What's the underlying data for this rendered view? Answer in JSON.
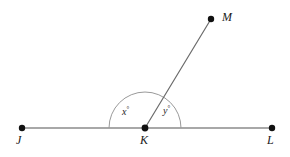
{
  "figure": {
    "type": "geometry-diagram",
    "width": 290,
    "height": 157,
    "background_color": "#ffffff",
    "line_color": "#8c8c8c",
    "ray_color": "#6b6b6b",
    "arc_color": "#9a9a9a",
    "point_color": "#111111",
    "label_color": "#1a1a1a"
  },
  "points": [
    {
      "id": "J",
      "label": "J",
      "x": 22,
      "y": 128,
      "label_x": 16,
      "label_y": 134,
      "radius": 3.2
    },
    {
      "id": "K",
      "label": "K",
      "x": 145,
      "y": 128,
      "label_x": 140,
      "label_y": 134,
      "radius": 3.4
    },
    {
      "id": "L",
      "label": "L",
      "x": 272,
      "y": 128,
      "label_x": 267,
      "label_y": 134,
      "radius": 3.2
    },
    {
      "id": "M",
      "label": "M",
      "x": 211,
      "y": 19,
      "label_x": 222,
      "label_y": 11,
      "radius": 3.2
    }
  ],
  "segments": [
    {
      "id": "JL",
      "from": "J",
      "to": "L",
      "x1": 22,
      "y1": 128,
      "x2": 272,
      "y2": 128,
      "stroke": "#8c8c8c",
      "width": 1.4
    },
    {
      "id": "KM",
      "from": "K",
      "to": "M",
      "x1": 145,
      "y1": 128,
      "x2": 211,
      "y2": 19,
      "stroke": "#6b6b6b",
      "width": 1.2
    }
  ],
  "arc": {
    "center_x": 145,
    "center_y": 128,
    "radius": 36,
    "start_x": 109,
    "start_y": 128,
    "end_x": 181,
    "end_y": 128,
    "start_angle_deg": 180,
    "end_angle_deg": 0,
    "stroke": "#9a9a9a",
    "width": 1.0
  },
  "angles": [
    {
      "id": "x",
      "variable": "x",
      "degree_symbol": "°",
      "label_x": 122,
      "label_y": 106,
      "between": [
        "KJ",
        "KM"
      ]
    },
    {
      "id": "y",
      "variable": "y",
      "degree_symbol": "°",
      "label_x": 163,
      "label_y": 105,
      "between": [
        "KM",
        "KL"
      ]
    }
  ]
}
